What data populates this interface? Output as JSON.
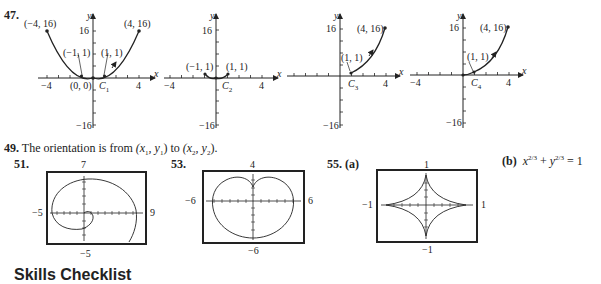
{
  "problems": {
    "p47": {
      "number": "47.",
      "graphs": [
        {
          "curve": "C1",
          "curve_label": "C",
          "curve_sub": "1",
          "points": [
            "(−4, 16)",
            "(4, 16)",
            "(−1, 1)",
            "(1, 1)",
            "(0, 0)"
          ]
        },
        {
          "curve": "C2",
          "curve_label": "C",
          "curve_sub": "2",
          "points": [
            "(−1, 1)",
            "(1, 1)"
          ]
        },
        {
          "curve": "C3",
          "curve_label": "C",
          "curve_sub": "3",
          "points": [
            "(4, 16)",
            "(1, 1)"
          ]
        },
        {
          "curve": "C4",
          "curve_label": "C",
          "curve_sub": "4",
          "points": [
            "(4, 16)",
            "(1, 1)"
          ]
        }
      ],
      "axis": {
        "x": "x",
        "y": "y",
        "x_min": "−4",
        "x_max": "4",
        "y_max": "16",
        "y_min": "−16"
      }
    },
    "p49": {
      "number": "49.",
      "text_a": "The orientation is from ",
      "p1": "(x",
      "p1_sub1": "1",
      "p1_mid": ", y",
      "p1_sub2": "1",
      "p1_end": ")",
      "to": " to ",
      "p2": "(x",
      "p2_sub1": "2",
      "p2_mid": ", y",
      "p2_sub2": "2",
      "p2_end": ")."
    },
    "p51": {
      "number": "51.",
      "window": {
        "top": "7",
        "bottom": "−5",
        "left": "−5",
        "right": "9"
      }
    },
    "p53": {
      "number": "53.",
      "window": {
        "top": "4",
        "bottom": "−6",
        "left": "−6",
        "right": "6"
      }
    },
    "p55": {
      "number": "55.",
      "part_a": "(a)",
      "window": {
        "top": "1",
        "bottom": "−1",
        "left": "−1",
        "right": "1"
      },
      "part_b": "(b)",
      "equation": {
        "x": "x",
        "exp1": "2/3",
        "plus": " + ",
        "y": "y",
        "exp2": "2/3",
        "eq": " = 1"
      }
    }
  },
  "footer_heading": "Skills Checklist"
}
